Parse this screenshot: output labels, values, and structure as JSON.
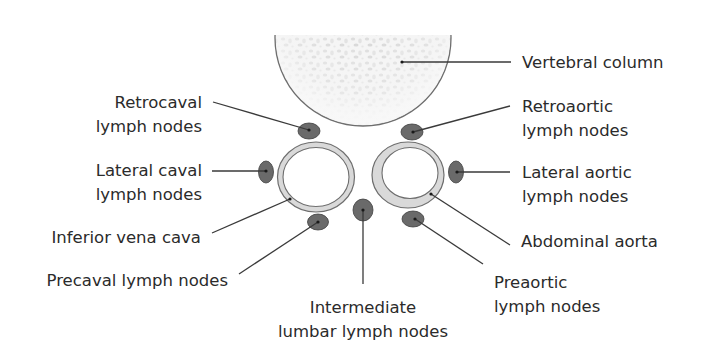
{
  "colors": {
    "background": "#ffffff",
    "text": "#2b2b2b",
    "leader_line": "#3a3a3a",
    "lymph_node_fill": "#6a6a6a",
    "vessel_wall": "#d9d9d9",
    "vessel_outline": "#6e6e6e",
    "vertebra_fill": "#f2f2f2",
    "vertebra_outline": "#6e6e6e"
  },
  "structures": {
    "vertebral_column": {
      "label": "Vertebral column"
    },
    "inferior_vena_cava": {
      "label": "Inferior vena cava"
    },
    "abdominal_aorta": {
      "label": "Abdominal aorta"
    }
  },
  "labels": {
    "vertebral_column": {
      "line1": "Vertebral column"
    },
    "retrocaval": {
      "line1": "Retrocaval",
      "line2": "lymph nodes"
    },
    "retroaortic": {
      "line1": "Retroaortic",
      "line2": "lymph nodes"
    },
    "lateral_caval": {
      "line1": "Lateral caval",
      "line2": "lymph nodes"
    },
    "lateral_aortic": {
      "line1": "Lateral aortic",
      "line2": "lymph nodes"
    },
    "inferior_vena_cava": {
      "line1": "Inferior vena cava"
    },
    "abdominal_aorta": {
      "line1": "Abdominal aorta"
    },
    "precaval": {
      "line1": "Precaval lymph nodes"
    },
    "preaortic": {
      "line1": "Preaortic",
      "line2": "lymph nodes"
    },
    "intermediate_lumbar": {
      "line1": "Intermediate",
      "line2": "lumbar lymph nodes"
    }
  }
}
